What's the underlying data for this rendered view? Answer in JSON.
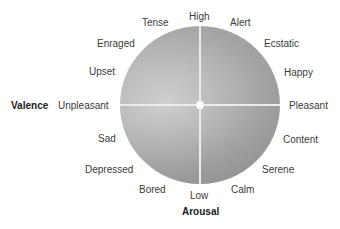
{
  "diagram": {
    "type": "circumplex-model-of-affect",
    "axes": {
      "horizontal": {
        "title": "Valence",
        "left": "Unpleasant",
        "right": "Pleasant"
      },
      "vertical": {
        "title": "Arousal",
        "top": "High",
        "bottom": "Low"
      }
    },
    "emotions": {
      "tense": "Tense",
      "alert": "Alert",
      "enraged": "Enraged",
      "ecstatic": "Ecstatic",
      "upset": "Upset",
      "happy": "Happy",
      "sad": "Sad",
      "content": "Content",
      "depressed": "Depressed",
      "serene": "Serene",
      "bored": "Bored",
      "calm": "Calm"
    },
    "colors": {
      "circle_light": "#cfcfcf",
      "circle_dark": "#979797",
      "axis_line": "#ececec",
      "text": "#3a3a3a",
      "axis_title": "#1a1a1a"
    }
  }
}
